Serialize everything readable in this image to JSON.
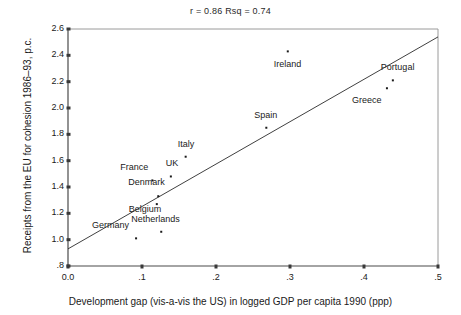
{
  "chart_data": {
    "type": "scatter",
    "title": "r = 0.86   Rsq = 0.74",
    "xlabel": "Development gap (vis-a-vis the US) in logged GDP per capita 1990 (ppp)",
    "ylabel": "Receipts from the EU for cohesion 1986–93, p.c.",
    "xlim": [
      0.0,
      0.5
    ],
    "ylim": [
      0.8,
      2.6
    ],
    "xticks": [
      0.0,
      0.1,
      0.2,
      0.3,
      0.4,
      0.5
    ],
    "xtick_labels": [
      "0.0",
      ".1",
      ".2",
      ".3",
      ".4",
      ".5"
    ],
    "yticks": [
      0.8,
      1.0,
      1.2,
      1.4,
      1.6,
      1.8,
      2.0,
      2.2,
      2.4,
      2.6
    ],
    "ytick_labels": [
      ".8",
      "1.0",
      "1.2",
      "1.4",
      "1.6",
      "1.8",
      "2.0",
      "2.2",
      "2.4",
      "2.6"
    ],
    "grid": false,
    "legend": "none",
    "r": 0.86,
    "rsq": 0.74,
    "points": [
      {
        "label": "Germany",
        "x": 0.092,
        "y": 1.01,
        "label_dx": -44,
        "label_dy": -13
      },
      {
        "label": "Netherlands",
        "x": 0.126,
        "y": 1.06,
        "label_dx": -30,
        "label_dy": -13
      },
      {
        "label": "Belgium",
        "x": 0.12,
        "y": 1.27,
        "label_dx": -28,
        "label_dy": 5
      },
      {
        "label": "Denmark",
        "x": 0.122,
        "y": 1.33,
        "label_dx": -30,
        "label_dy": -14
      },
      {
        "label": "France",
        "x": 0.114,
        "y": 1.45,
        "label_dx": -32,
        "label_dy": -13
      },
      {
        "label": "UK",
        "x": 0.139,
        "y": 1.48,
        "label_dx": -5,
        "label_dy": -13
      },
      {
        "label": "Italy",
        "x": 0.159,
        "y": 1.63,
        "label_dx": -8,
        "label_dy": -13
      },
      {
        "label": "Spain",
        "x": 0.268,
        "y": 1.85,
        "label_dx": -12,
        "label_dy": -13
      },
      {
        "label": "Ireland",
        "x": 0.297,
        "y": 2.43,
        "label_dx": -14,
        "label_dy": 13
      },
      {
        "label": "Greece",
        "x": 0.431,
        "y": 2.15,
        "label_dx": -35,
        "label_dy": 12
      },
      {
        "label": "Portugal",
        "x": 0.439,
        "y": 2.21,
        "label_dx": -12,
        "label_dy": -13
      }
    ],
    "fit_line": {
      "x0": 0.0,
      "y0": 0.93,
      "x1": 0.5,
      "y1": 2.54
    }
  }
}
